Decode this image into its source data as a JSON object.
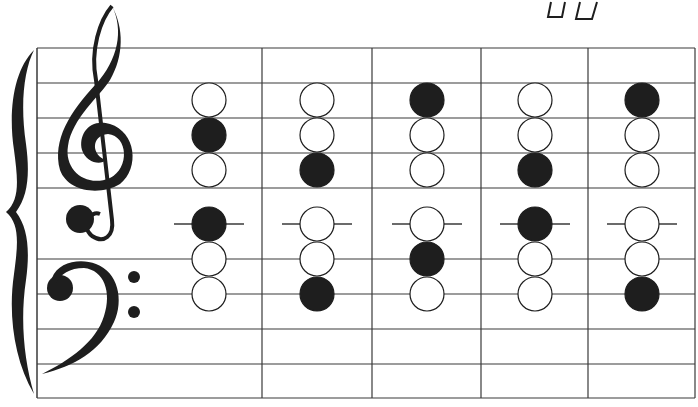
{
  "diagram": {
    "type": "grand-staff-note-grid",
    "colors": {
      "ink": "#1e1e1e",
      "line": "#3a3a3a",
      "background": "#ffffff"
    },
    "top_right_marks": "ᗜᗜ",
    "staff": {
      "left": 37,
      "right": 695,
      "top": 48,
      "bottom": 398,
      "horizontal_lines_y": [
        48,
        83,
        118,
        153,
        188,
        259,
        294,
        329,
        364,
        398
      ],
      "column_dividers_x": [
        262,
        372,
        481,
        588,
        695
      ]
    },
    "clefs": [
      "treble-clef",
      "bass-clef"
    ],
    "note_rows_y": [
      100,
      135,
      170,
      224,
      259,
      294
    ],
    "ledger_row_index": 3,
    "note_radius": 17,
    "columns": [
      {
        "x": 209,
        "notes": [
          false,
          true,
          false,
          true,
          false,
          false
        ]
      },
      {
        "x": 317,
        "notes": [
          false,
          false,
          true,
          false,
          false,
          true
        ]
      },
      {
        "x": 427,
        "notes": [
          true,
          false,
          false,
          false,
          true,
          false
        ]
      },
      {
        "x": 535,
        "notes": [
          false,
          false,
          true,
          true,
          false,
          false
        ]
      },
      {
        "x": 642,
        "notes": [
          true,
          false,
          false,
          false,
          false,
          true
        ]
      }
    ]
  }
}
